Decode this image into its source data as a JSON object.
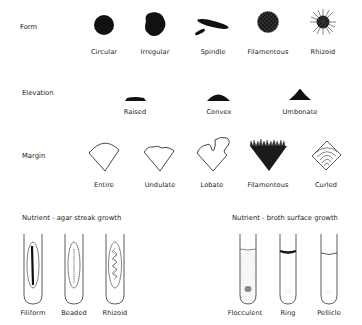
{
  "form": {
    "label": "Form",
    "items": [
      {
        "name": "Circular",
        "x": 104
      },
      {
        "name": "Irregular",
        "x": 155
      },
      {
        "name": "Spindle",
        "x": 208
      },
      {
        "name": "Filamentous",
        "x": 268
      },
      {
        "name": "Rhizoid",
        "x": 323
      }
    ]
  },
  "elevation": {
    "label": "Elevation",
    "items": [
      {
        "name": "Raised",
        "x": 135
      },
      {
        "name": "Convex",
        "x": 218
      },
      {
        "name": "Umbonate",
        "x": 300
      }
    ]
  },
  "margin": {
    "label": "Margin",
    "items": [
      {
        "name": "Entire",
        "x": 104
      },
      {
        "name": "Undulate",
        "x": 160
      },
      {
        "name": "Lobate",
        "x": 212
      },
      {
        "name": "Filamentous",
        "x": 268
      },
      {
        "name": "Curled",
        "x": 326
      }
    ]
  },
  "agar": {
    "title": "Nutrient - agar streak growth",
    "items": [
      {
        "name": "Filiform",
        "x": 33
      },
      {
        "name": "Beaded",
        "x": 73
      },
      {
        "name": "Rhizoid",
        "x": 114
      }
    ]
  },
  "broth": {
    "title": "Nutrient - broth surface growth",
    "items": [
      {
        "name": "Flocculent",
        "x": 248
      },
      {
        "name": "Ring",
        "x": 288
      },
      {
        "name": "Pellicle",
        "x": 329
      }
    ]
  },
  "colors": {
    "ink": "#111111",
    "background": "#ffffff",
    "broth_stipple": "#cfcfcf"
  }
}
